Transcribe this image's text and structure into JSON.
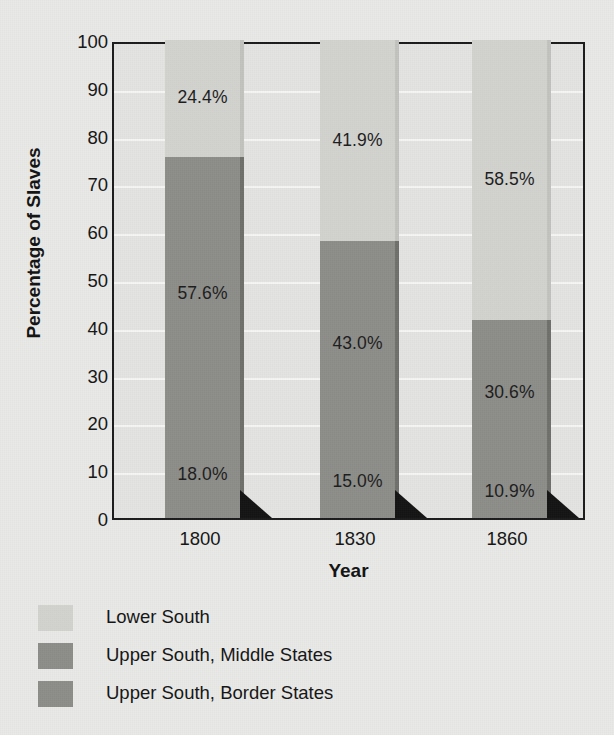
{
  "chart_data": {
    "type": "bar",
    "subtype": "stacked-bar-100",
    "title": "",
    "xlabel": "Year",
    "ylabel": "Percentage of Slaves",
    "categories": [
      "1800",
      "1830",
      "1860"
    ],
    "ylim": [
      0,
      100
    ],
    "yticks": [
      "0",
      "10",
      "20",
      "30",
      "40",
      "50",
      "60",
      "70",
      "80",
      "90",
      "100"
    ],
    "grid": true,
    "legend_position": "below",
    "series": [
      {
        "name": "Lower South",
        "color": "#d2d2cf",
        "values": [
          24.4,
          41.9,
          58.5
        ],
        "labels": [
          "24.4%",
          "41.9%",
          "58.5%"
        ]
      },
      {
        "name": "Upper South, Middle States",
        "color": "#8d8d89",
        "values": [
          57.6,
          43.0,
          30.6
        ],
        "labels": [
          "57.6%",
          "43.0%",
          "30.6%"
        ]
      },
      {
        "name": "Upper South, Border States",
        "color": "#8d8d89",
        "values": [
          18.0,
          15.0,
          10.9
        ],
        "labels": [
          "18.0%",
          "15.0%",
          "10.9%"
        ]
      }
    ]
  }
}
